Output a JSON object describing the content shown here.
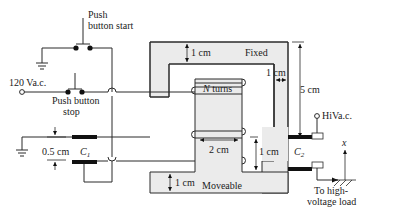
{
  "labels": {
    "push_start_line1": "Push",
    "push_start_line2": "button start",
    "push_stop_line1": "Push button",
    "push_stop_line2": "stop",
    "source": "120 Va.c.",
    "fixed": "Fixed",
    "moveable": "Moveable",
    "n_turns_N": "N",
    "n_turns_rest": " turns",
    "dim_top": "1 cm",
    "dim_right": "1 cm",
    "dim_height": "5 cm",
    "dim_width": "2 cm",
    "dim_gap": "1 cm",
    "dim_bottom": "1 cm",
    "dim_cap": "0.5 cm",
    "c1_C": "C",
    "c1_sub": "1",
    "c2_C": "C",
    "c2_sub": "2",
    "hiv": "HiVa.c.",
    "load_line1": "To high-",
    "load_line2": "voltage load",
    "axis_x": "x"
  },
  "colors": {
    "core_fill": "#ebebeb",
    "line": "#2a2a2a",
    "plate": "#111111"
  }
}
